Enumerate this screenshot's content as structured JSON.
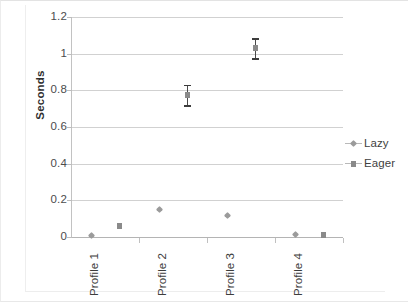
{
  "chart_data": {
    "type": "scatter",
    "title": "",
    "subtitle": "",
    "xlabel": "",
    "ylabel": "Seconds",
    "categories": [
      "Profile 1",
      "Profile 2",
      "Profile 3",
      "Profile 4"
    ],
    "ylim": [
      0,
      1.2
    ],
    "y_ticks": [
      "0",
      "0.2",
      "0.4",
      "0.6",
      "0.8",
      "1",
      "1.2"
    ],
    "y_tick_values": [
      0,
      0.2,
      0.4,
      0.6,
      0.8,
      1,
      1.2
    ],
    "grid": true,
    "legend_position": "right",
    "series": [
      {
        "name": "Lazy",
        "marker": "diamond",
        "color": "#9b9b9b",
        "values": [
          0.005,
          0.15,
          0.115,
          0.01
        ],
        "errors": [
          0,
          0,
          0,
          0
        ]
      },
      {
        "name": "Eager",
        "marker": "square",
        "color": "#8a8a8a",
        "values": [
          0.06,
          0.775,
          1.03,
          0.01
        ],
        "errors": [
          0,
          0.055,
          0.055,
          0
        ]
      }
    ]
  },
  "axes": {
    "y_title": "Seconds",
    "y_tick_labels": [
      "1.2",
      "1",
      "0.8",
      "0.6",
      "0.4",
      "0.2",
      "0"
    ],
    "x_tick_labels": [
      "Profile 1",
      "Profile 2",
      "Profile 3",
      "Profile 4"
    ]
  },
  "legend": {
    "entries": [
      {
        "label": "Lazy"
      },
      {
        "label": "Eager"
      }
    ]
  },
  "colors": {
    "gridline": "#c9c9c9",
    "axis": "#b4b4b4",
    "lazy": "#9b9b9b",
    "eager": "#8a8a8a",
    "errorbar": "#3c3c3c",
    "text": "#3f3f3f",
    "background": "#ffffff"
  }
}
